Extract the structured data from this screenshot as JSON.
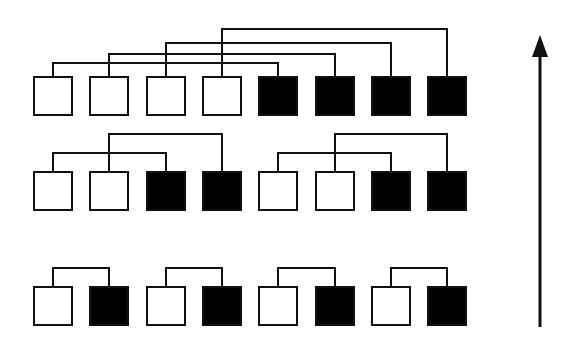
{
  "diagram": {
    "type": "butterfly-pairing-network",
    "colors": {
      "open_fill": "#ffffff",
      "filled_fill": "#000000",
      "stroke": "#111111",
      "background": "#ffffff"
    },
    "square_size": 38,
    "columns_x": [
      34,
      90,
      147,
      203,
      259,
      316,
      372,
      428
    ],
    "rows": [
      {
        "name": "stage-3-top",
        "y": 77,
        "fills": [
          "open",
          "open",
          "open",
          "open",
          "filled",
          "filled",
          "filled",
          "filled"
        ],
        "links": [
          {
            "from": 0,
            "to": 4,
            "y": 63
          },
          {
            "from": 1,
            "to": 5,
            "y": 54
          },
          {
            "from": 2,
            "to": 6,
            "y": 43
          },
          {
            "from": 3,
            "to": 7,
            "y": 29
          }
        ]
      },
      {
        "name": "stage-2-middle",
        "y": 172,
        "fills": [
          "open",
          "open",
          "filled",
          "filled",
          "open",
          "open",
          "filled",
          "filled"
        ],
        "links": [
          {
            "from": 0,
            "to": 2,
            "y": 153
          },
          {
            "from": 1,
            "to": 3,
            "y": 134
          },
          {
            "from": 4,
            "to": 6,
            "y": 153
          },
          {
            "from": 5,
            "to": 7,
            "y": 134
          }
        ]
      },
      {
        "name": "stage-1-bottom",
        "y": 287,
        "fills": [
          "open",
          "filled",
          "open",
          "filled",
          "open",
          "filled",
          "open",
          "filled"
        ],
        "links": [
          {
            "from": 0,
            "to": 1,
            "y": 268
          },
          {
            "from": 2,
            "to": 3,
            "y": 268
          },
          {
            "from": 4,
            "to": 5,
            "y": 268
          },
          {
            "from": 6,
            "to": 7,
            "y": 268
          }
        ]
      }
    ],
    "arrow": {
      "x": 540,
      "y_start": 327,
      "y_end": 35,
      "direction": "up"
    }
  }
}
